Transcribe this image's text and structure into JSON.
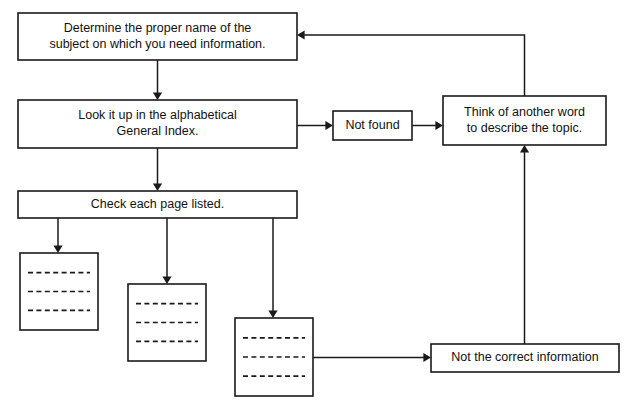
{
  "diagram": {
    "background_color": "#ffffff",
    "line_color": "#1a1a1a",
    "text_color": "#111111",
    "nodes": [
      {
        "id": "determine-name",
        "name": "determine-subject-name-box",
        "lines": [
          "Determine the proper name of the",
          "subject on which you need information."
        ],
        "x": 18,
        "y": 13,
        "w": 279,
        "h": 47
      },
      {
        "id": "look-it-up",
        "name": "look-up-general-index-box",
        "lines": [
          "Look it up in the alphabetical",
          "General Index."
        ],
        "x": 18,
        "y": 100,
        "w": 279,
        "h": 48
      },
      {
        "id": "check-pages",
        "name": "check-each-page-box",
        "lines": [
          "Check each page listed."
        ],
        "x": 18,
        "y": 191,
        "w": 279,
        "h": 27
      },
      {
        "id": "not-found",
        "name": "not-found-box",
        "lines": [
          "Not found"
        ],
        "x": 333,
        "y": 111,
        "w": 79,
        "h": 29
      },
      {
        "id": "think-another-word",
        "name": "think-of-another-word-box",
        "lines": [
          "Think of another word",
          "to describe the topic."
        ],
        "x": 443,
        "y": 96,
        "w": 163,
        "h": 49
      },
      {
        "id": "not-correct-info",
        "name": "not-the-correct-information-box",
        "lines": [
          "Not the correct information"
        ],
        "x": 431,
        "y": 344,
        "w": 188,
        "h": 28
      }
    ],
    "page_nodes": [
      {
        "id": "page-1",
        "name": "page-result-1",
        "x": 20,
        "y": 253,
        "w": 78,
        "h": 77,
        "rules": 3
      },
      {
        "id": "page-2",
        "name": "page-result-2",
        "x": 128,
        "y": 284,
        "w": 78,
        "h": 77,
        "rules": 3
      },
      {
        "id": "page-3",
        "name": "page-result-3",
        "x": 235,
        "y": 318,
        "w": 78,
        "h": 78,
        "rules": 3
      }
    ],
    "connectors": [
      {
        "id": "c1",
        "name": "connector-determine-to-lookup",
        "from": "determine-name",
        "to": "look-it-up",
        "path": "M 157.5 60 L 157.5 96",
        "arrow": "down",
        "ax": 157.5,
        "ay": 100
      },
      {
        "id": "c2",
        "name": "connector-lookup-to-check",
        "from": "look-it-up",
        "to": "check-pages",
        "path": "M 157.5 148 L 157.5 187",
        "arrow": "down",
        "ax": 157.5,
        "ay": 191
      },
      {
        "id": "c3",
        "name": "connector-lookup-to-notfound",
        "from": "look-it-up",
        "to": "not-found",
        "path": "M 297 125.5 L 329 125.5",
        "arrow": "right",
        "ax": 333,
        "ay": 125.5
      },
      {
        "id": "c4",
        "name": "connector-notfound-to-think",
        "from": "not-found",
        "to": "think-another-word",
        "path": "M 412 125.5 L 439 125.5",
        "arrow": "right",
        "ax": 443,
        "ay": 125.5
      },
      {
        "id": "c5",
        "name": "connector-think-to-determine-feedback",
        "from": "think-another-word",
        "to": "determine-name",
        "path": "M 524.5 96 L 524.5 35 L 301 35",
        "arrow": "left",
        "ax": 297,
        "ay": 35
      },
      {
        "id": "c6",
        "name": "connector-notcorrect-to-think",
        "from": "not-correct-info",
        "to": "think-another-word",
        "path": "M 524.5 344 L 524.5 149",
        "arrow": "up",
        "ax": 524.5,
        "ay": 145
      },
      {
        "id": "c7",
        "name": "connector-check-to-page1",
        "from": "check-pages",
        "to": "page-1",
        "path": "M 58 218 L 58 249",
        "arrow": "down",
        "ax": 58,
        "ay": 253
      },
      {
        "id": "c8",
        "name": "connector-check-to-page2",
        "from": "check-pages",
        "to": "page-2",
        "path": "M 167 218 L 167 280",
        "arrow": "down",
        "ax": 167,
        "ay": 284
      },
      {
        "id": "c9",
        "name": "connector-check-to-page3",
        "from": "check-pages",
        "to": "page-3",
        "path": "M 273 218 L 273 314",
        "arrow": "down",
        "ax": 273,
        "ay": 318
      },
      {
        "id": "c10",
        "name": "connector-page3-to-notcorrect",
        "from": "page-3",
        "to": "not-correct-info",
        "path": "M 313 357.5 L 427 357.5",
        "arrow": "right",
        "ax": 431,
        "ay": 357.5
      }
    ]
  }
}
